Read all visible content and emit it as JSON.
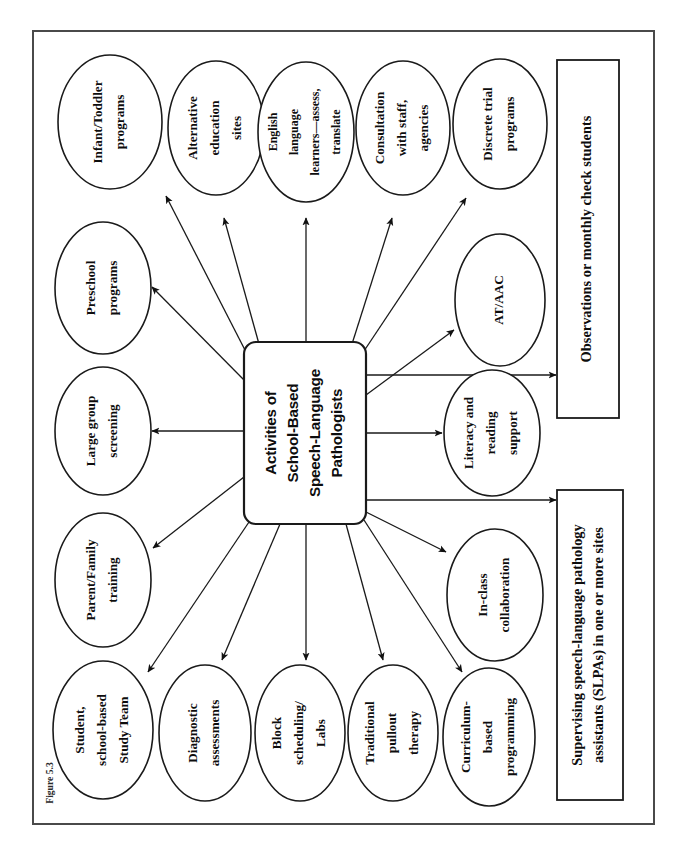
{
  "figure": {
    "caption": "Figure 5.3",
    "title": "Activities of School-Based Speech-Language Pathologists",
    "orientation": "rotated-90-ccw",
    "frame_color": "#4a4a4a",
    "ink_color": "#1a1a1a"
  },
  "hub": {
    "lines": [
      "Activities of",
      "School-Based",
      "Speech-Language",
      "Pathologists"
    ]
  },
  "nodes": [
    {
      "id": "infant-toddler-programs",
      "lines": [
        "Infant/Toddler",
        "programs"
      ]
    },
    {
      "id": "alternative-education-sites",
      "lines": [
        "Alternative",
        "education",
        "sites"
      ]
    },
    {
      "id": "english-language-learners",
      "lines": [
        "English",
        "language",
        "learners—assess,",
        "translate"
      ]
    },
    {
      "id": "consultation-with-staff",
      "lines": [
        "Consultation",
        "with staff,",
        "agencies"
      ]
    },
    {
      "id": "discrete-trial-programs",
      "lines": [
        "Discrete trial",
        "programs"
      ]
    },
    {
      "id": "preschool-programs",
      "lines": [
        "Preschool",
        "programs"
      ]
    },
    {
      "id": "at-aac",
      "lines": [
        "AT/AAC"
      ]
    },
    {
      "id": "large-group-screening",
      "lines": [
        "Large group",
        "screening"
      ]
    },
    {
      "id": "literacy-and-reading-support",
      "lines": [
        "Literacy and",
        "reading",
        "support"
      ]
    },
    {
      "id": "parent-family-training",
      "lines": [
        "Parent/Family",
        "training"
      ]
    },
    {
      "id": "in-class-collaboration",
      "lines": [
        "In-class",
        "collaboration"
      ]
    },
    {
      "id": "student-school-based-study-team",
      "lines": [
        "Student,",
        "school-based",
        "Study Team"
      ]
    },
    {
      "id": "diagnostic-assessments",
      "lines": [
        "Diagnostic",
        "assessments"
      ]
    },
    {
      "id": "block-scheduling-labs",
      "lines": [
        "Block",
        "scheduling/",
        "Labs"
      ]
    },
    {
      "id": "traditional-pullout-therapy",
      "lines": [
        "Traditional",
        "pullout",
        "therapy"
      ]
    },
    {
      "id": "curriculum-based-programming",
      "lines": [
        "Curriculum-",
        "based",
        "programming"
      ]
    }
  ],
  "boxes": [
    {
      "id": "observations-box",
      "lines": [
        "Observations or monthly check students"
      ]
    },
    {
      "id": "supervising-slpas-box",
      "lines": [
        "Supervising speech-language pathology",
        "assistants (SLPAs) in one or more sites"
      ]
    }
  ]
}
